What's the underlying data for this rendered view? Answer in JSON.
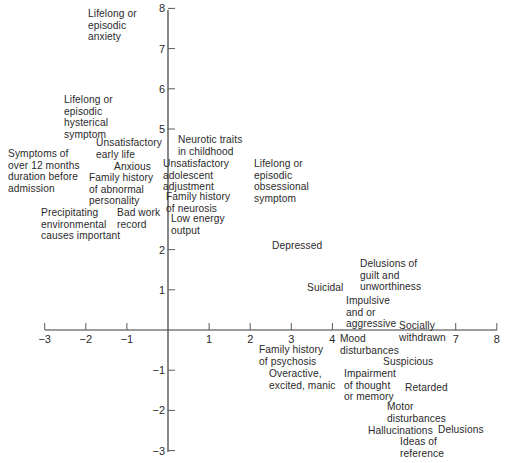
{
  "chart_data": {
    "type": "scatter",
    "title": "",
    "xlabel": "",
    "ylabel": "",
    "xlim": [
      -3,
      8
    ],
    "ylim": [
      -3,
      8
    ],
    "grid": false,
    "x_ticks": [
      -3,
      -2,
      -1,
      1,
      2,
      3,
      4,
      7,
      8
    ],
    "y_ticks": [
      -3,
      -2,
      -1,
      1,
      2,
      5,
      6,
      7,
      8
    ],
    "x_tick_labels": [
      "−3",
      "−2",
      "−1",
      "1",
      "2",
      "3",
      "4",
      "7",
      "8"
    ],
    "y_tick_labels": [
      "−3",
      "−2",
      "−1",
      "1",
      "2",
      "5",
      "6",
      "7",
      "8"
    ],
    "points": [
      {
        "label": "Lifelong or\nepisodic\nanxiety",
        "x": -1.2,
        "y": 7.3
      },
      {
        "label": "Lifelong or\nepisodic\nhysterical\nsymptom",
        "x": -2.0,
        "y": 5.4
      },
      {
        "label": "Unsatisfactory\nearly life",
        "x": -1.0,
        "y": 4.8
      },
      {
        "label": "Symptoms of\nover 12 months\nduration before\nadmission",
        "x": -3.5,
        "y": 4.2
      },
      {
        "label": "Anxious",
        "x": -0.8,
        "y": 4.5
      },
      {
        "label": "Family history\nof abnormal\npersonality",
        "x": -1.0,
        "y": 4.0
      },
      {
        "label": "Neurotic traits\nin childhood",
        "x": 0.6,
        "y": 4.9
      },
      {
        "label": "Unsatisfactory\nadolescent\nadjustment",
        "x": 0.5,
        "y": 4.3
      },
      {
        "label": "Lifelong or\nepisodic\nobsessional\nsymptom",
        "x": 2.6,
        "y": 4.3
      },
      {
        "label": "Family history\nof neurosis",
        "x": 0.6,
        "y": 3.5
      },
      {
        "label": "Precipitating\nenvironmental\ncauses important",
        "x": -2.5,
        "y": 3.1
      },
      {
        "label": "Bad work\nrecord",
        "x": -0.5,
        "y": 3.2
      },
      {
        "label": "Low energy\noutput",
        "x": 0.6,
        "y": 2.9
      },
      {
        "label": "Depressed",
        "x": 3.4,
        "y": 2.1
      },
      {
        "label": "Suicidal",
        "x": 3.6,
        "y": 1.0
      },
      {
        "label": "Delusions of\nguilt and\nunworthiness",
        "x": 5.0,
        "y": 1.3
      },
      {
        "label": "Impulsive\nand or\naggressive",
        "x": 4.7,
        "y": 0.4
      },
      {
        "label": "Socially\nwithdrawn",
        "x": 6.3,
        "y": 0.0
      },
      {
        "label": "Mood\ndisturbances",
        "x": 4.6,
        "y": -0.2
      },
      {
        "label": "Family history\nof psychosis",
        "x": 2.8,
        "y": -0.4
      },
      {
        "label": "Suspicious",
        "x": 5.8,
        "y": -0.7
      },
      {
        "label": "Overactive,\nexcited, manic",
        "x": 3.1,
        "y": -1.2
      },
      {
        "label": "Impairment\nof thought\nor memory",
        "x": 4.7,
        "y": -1.2
      },
      {
        "label": "Retarded",
        "x": 6.1,
        "y": -1.3
      },
      {
        "label": "Motor\ndisturbances",
        "x": 5.9,
        "y": -1.9
      },
      {
        "label": "Hallucinations",
        "x": 5.6,
        "y": -2.4
      },
      {
        "label": "Delusions",
        "x": 7.2,
        "y": -2.4
      },
      {
        "label": "Ideas of\nreference",
        "x": 6.2,
        "y": -2.8
      }
    ]
  }
}
